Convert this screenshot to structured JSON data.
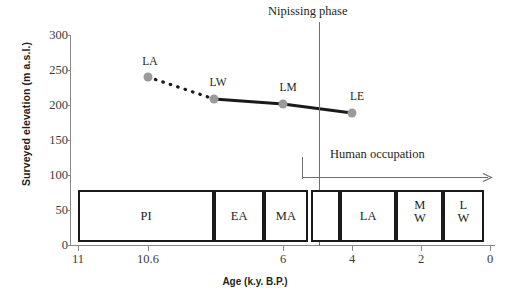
{
  "chart_data": {
    "type": "line",
    "title": "",
    "xlabel": "Age (k.y. B.P.)",
    "ylabel": "Surveyed elevation (m a.s.l.)",
    "xticks": [
      "11",
      "10.6",
      "6",
      "4",
      "2",
      "0"
    ],
    "xtick_values": [
      11,
      10.6,
      6,
      4,
      2,
      0
    ],
    "yticks": [
      "0",
      "50",
      "100",
      "150",
      "200",
      "250",
      "300"
    ],
    "ytick_values": [
      0,
      50,
      100,
      150,
      200,
      250,
      300
    ],
    "ylim": [
      0,
      300
    ],
    "xlim": [
      11,
      0
    ],
    "x_axis_reversed": true,
    "grid": false,
    "legend": "none",
    "series": [
      {
        "name": "Surveyed lake level elevations",
        "points": [
          {
            "label": "LA",
            "x": 10.6,
            "y": 242,
            "marker": "circle"
          },
          {
            "label": "LW",
            "x": 8.6,
            "y": 213,
            "marker": "circle"
          },
          {
            "label": "LM",
            "x": 6.0,
            "y": 208,
            "marker": "circle"
          },
          {
            "label": "LE",
            "x": 4.0,
            "y": 193,
            "marker": "circle"
          }
        ],
        "segments": [
          {
            "from": "LA",
            "to": "LW",
            "style": "dotted"
          },
          {
            "from": "LW",
            "to": "LM",
            "style": "solid"
          },
          {
            "from": "LM",
            "to": "LE",
            "style": "solid"
          }
        ]
      }
    ],
    "annotations": [
      {
        "name": "nipissing-phase",
        "text": "Nipissing phase",
        "x": 5.0,
        "type": "vertical-line"
      },
      {
        "name": "human-occupation",
        "text": "Human occupation",
        "x_start": 5.5,
        "x_end": 0,
        "type": "arrow-right"
      }
    ],
    "stratigraphic_band": {
      "name": "cultural-periods",
      "segments": [
        {
          "label": "PI",
          "lines": [
            "PI"
          ],
          "x_start": 11.0,
          "x_end": 8.55
        },
        {
          "label": "EA",
          "lines": [
            "EA"
          ],
          "x_start": 8.55,
          "x_end": 7.0
        },
        {
          "label": "MA",
          "lines": [
            "MA"
          ],
          "x_start": 7.0,
          "x_end": 5.65
        },
        {
          "label": "",
          "lines": [
            ""
          ],
          "x_start": 5.55,
          "x_end": 4.65
        },
        {
          "label": "LA",
          "lines": [
            "LA"
          ],
          "x_start": 4.65,
          "x_end": 2.9
        },
        {
          "label": "MW",
          "lines": [
            "M",
            "W"
          ],
          "x_start": 2.9,
          "x_end": 1.45
        },
        {
          "label": "LW",
          "lines": [
            "L",
            "W"
          ],
          "x_start": 1.45,
          "x_end": 0.2
        }
      ]
    },
    "colors": {
      "marker": "#9a9a9a",
      "line": "#1a1a1a",
      "axis": "#8a8a8a",
      "annotation": "#6f6f6f",
      "box_border": "#1a1a1a",
      "text": "#231f20",
      "background": "#ffffff"
    }
  }
}
